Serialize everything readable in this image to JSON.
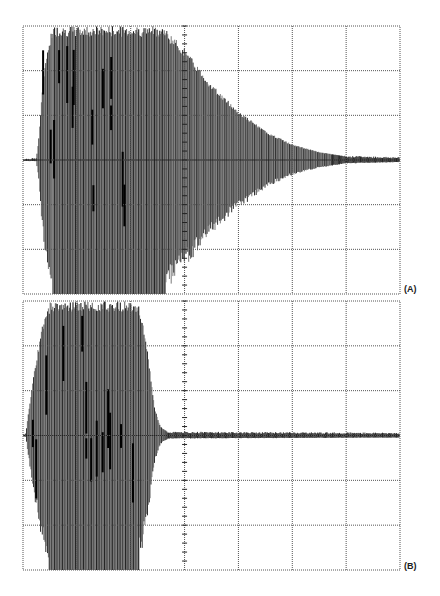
{
  "figure": {
    "background": "#ffffff",
    "grid_color": "#555555",
    "trace_color": "#1a1a1a",
    "trace_fill": "#6a6a6a"
  },
  "chart_data": [
    {
      "type": "line",
      "title": "",
      "label": "(A)",
      "xlabel": "",
      "ylabel": "",
      "grid": true,
      "x_divisions": 7,
      "y_divisions": 6,
      "center_marker_division": 3,
      "description": "Oscilloscope trace: oscillation burst clipped at full scale from div 0.3 to ~2.6, then slow exponential decay to baseline near div 6",
      "frame": {
        "x": 23,
        "y": 26,
        "width": 377,
        "height": 268
      },
      "envelope": {
        "x_div": [
          0.0,
          0.25,
          0.3,
          0.35,
          0.45,
          0.55,
          2.6,
          3.0,
          3.5,
          4.0,
          4.5,
          5.0,
          5.5,
          6.0,
          7.0
        ],
        "amplitude_div": [
          0.02,
          0.03,
          0.6,
          1.5,
          2.5,
          3.0,
          3.0,
          2.5,
          1.7,
          1.1,
          0.65,
          0.35,
          0.18,
          0.08,
          0.05
        ]
      }
    },
    {
      "type": "line",
      "title": "",
      "label": "(B)",
      "xlabel": "",
      "ylabel": "",
      "grid": true,
      "x_divisions": 7,
      "y_divisions": 6,
      "center_marker_division": 3,
      "description": "Oscilloscope trace: oscillation burst clipped at full scale from div 0.1 to ~2.2, then rapid cut-off (damped) to baseline noise by div 2.6",
      "frame": {
        "x": 23,
        "y": 301,
        "width": 377,
        "height": 269
      },
      "envelope": {
        "x_div": [
          0.0,
          0.05,
          0.1,
          0.2,
          0.35,
          0.5,
          2.15,
          2.3,
          2.45,
          2.55,
          2.7,
          7.0
        ],
        "amplitude_div": [
          0.02,
          0.03,
          0.5,
          1.4,
          2.4,
          3.0,
          3.0,
          2.0,
          0.6,
          0.2,
          0.07,
          0.05
        ]
      }
    }
  ]
}
